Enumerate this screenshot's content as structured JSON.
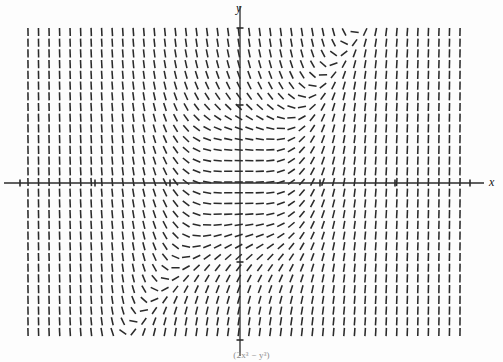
{
  "figure": {
    "kind": "slope-field",
    "y_axis_label": "y",
    "x_axis_label": "x",
    "caption": "(2x³ − y³)"
  },
  "chart_data": {
    "type": "scatter",
    "subtype": "slope-field",
    "title": "",
    "subtitle": "",
    "xlabel": "x",
    "ylabel": "y",
    "xlim": [
      -2.85,
      2.95
    ],
    "ylim": [
      -1.95,
      1.95
    ],
    "grid": false,
    "legend": null,
    "axes": {
      "x_axis_pixel_y": 183,
      "y_axis_pixel_x": 240,
      "x_ticks_pixels": [
        20,
        95,
        170,
        320,
        395,
        470
      ],
      "y_ticks_pixels": [
        28,
        105,
        262,
        340
      ],
      "x_tick_labels": [
        "",
        "",
        "",
        "",
        "",
        ""
      ],
      "y_tick_labels": [
        "",
        "",
        "",
        ""
      ],
      "x_tick_spacing_px": 75,
      "y_tick_spacing_px": 78,
      "tick_length_px": 7,
      "axis_color": "#2b2b2b",
      "axis_width_px": 1.3
    },
    "field": {
      "equation": "dy/dx = 2x^3 - y^3",
      "x_start_px": 28,
      "x_end_px": 460,
      "y_start_px": 32,
      "y_end_px": 332,
      "cols": 42,
      "rows": 29,
      "dash_length_px": 8.2,
      "dash_width_px": 1.55,
      "dash_color": "#2a2a2a",
      "units_per_pixel_x": 0.013333,
      "units_per_pixel_y": 0.012821
    },
    "features": [
      {
        "name": "spiral-center-quadrant-I",
        "x_px": 352,
        "y_px": 100
      },
      {
        "name": "spiral-center-quadrant-III",
        "x_px": 150,
        "y_px": 260
      },
      {
        "name": "nullcline-through-origin",
        "x_px": 240,
        "y_px": 183
      }
    ]
  }
}
